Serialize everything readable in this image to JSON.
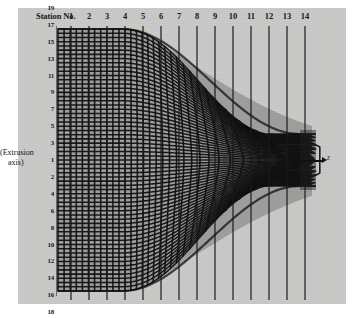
{
  "figure": {
    "title_text": "Station No.",
    "background_color": "#c9c9c7",
    "ink_color": "#111111",
    "axis_note_line1": "(Extrusion",
    "axis_note_line2": "axis)",
    "flow_direction_label": "z"
  },
  "station_numbers": [
    "1",
    "2",
    "3",
    "4",
    "5",
    "6",
    "7",
    "8",
    "9",
    "10",
    "11",
    "12",
    "13",
    "14"
  ],
  "station_x": [
    71,
    89,
    107,
    125,
    143,
    161,
    179,
    197,
    215,
    233,
    251,
    269,
    287,
    305
  ],
  "row_labels_upper": [
    "31",
    "29",
    "27",
    "25",
    "23",
    "21",
    "19",
    "17",
    "15",
    "13",
    "11",
    "9",
    "7",
    "5",
    "3",
    "1"
  ],
  "row_labels_lower": [
    "2",
    "4",
    "6",
    "8",
    "10",
    "12",
    "14",
    "16",
    "18",
    "20",
    "22",
    "24",
    "26",
    "28",
    "30"
  ],
  "chart_data": {
    "type": "line",
    "xlabel": "Station No.",
    "ylabel": "Grid row number (distance from extrusion axis)",
    "x_categories": [
      "1",
      "2",
      "3",
      "4",
      "5",
      "6",
      "7",
      "8",
      "9",
      "10",
      "11",
      "12",
      "13",
      "14"
    ],
    "y_upper_ticks": [
      "31",
      "29",
      "27",
      "25",
      "23",
      "21",
      "19",
      "17",
      "15",
      "13",
      "11",
      "9",
      "7",
      "5",
      "3",
      "1"
    ],
    "y_lower_ticks": [
      "2",
      "4",
      "6",
      "8",
      "10",
      "12",
      "14",
      "16",
      "18",
      "20",
      "22",
      "24",
      "26",
      "28",
      "30"
    ],
    "annotations": [
      "(Extrusion axis)",
      "z"
    ],
    "grid": true,
    "legend_position": "none"
  }
}
